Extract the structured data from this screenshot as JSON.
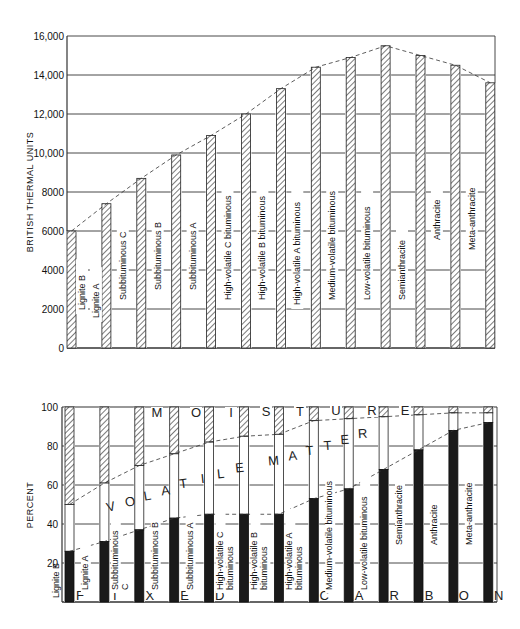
{
  "chart_data": [
    {
      "type": "bar",
      "title": "",
      "xlabel": "",
      "ylabel": "BRITISH THERMAL UNITS",
      "ylim": [
        0,
        16000
      ],
      "yticks": [
        "0",
        "2000",
        "4000",
        "6000",
        "8000",
        "10,000",
        "12,000",
        "14,000",
        "16,000"
      ],
      "grid": true,
      "trend_line": "dashed line connecting bar tops",
      "categories": [
        "Lignite B",
        "Lignite A",
        "Subbituminous C",
        "Subbituminous B",
        "Subbituminous A",
        "High-volatile C bituminous",
        "High-volatile B bituminous",
        "High-volatile A bituminous",
        "Medium-volatile bituminous",
        "Low-volatile bituminous",
        "Semianthracite",
        "Anthracite",
        "Meta-anthracite"
      ],
      "values": [
        6000,
        7400,
        8700,
        9900,
        10900,
        12000,
        13300,
        14400,
        14900,
        15500,
        15000,
        14500,
        13600
      ]
    },
    {
      "type": "bar",
      "stacked": true,
      "title": "",
      "xlabel": "",
      "ylabel": "PERCENT",
      "ylim": [
        0,
        100
      ],
      "yticks": [
        "20",
        "40",
        "60",
        "80",
        "100"
      ],
      "grid": true,
      "categories": [
        "Lignite B",
        "Lignite A",
        "Subbituminous C",
        "Subbituminous B",
        "Subbituminous A",
        "High-volatile C bituminous",
        "High-volatile B bituminous",
        "High-volatile A bituminous",
        "Medium-volatile bituminous",
        "Low-volatile bituminous",
        "Semianthracite",
        "Anthracite",
        "Meta-anthracite"
      ],
      "region_labels": {
        "moisture": "MOISTURE",
        "volatile_matter": "VOLATILE MATTER",
        "fixed_carbon": "FIXED CARBON"
      },
      "series": [
        {
          "name": "Fixed carbon",
          "fill": "solid black",
          "values": [
            26,
            31,
            37,
            43,
            45,
            45,
            45,
            53,
            58,
            68,
            78,
            88,
            92
          ]
        },
        {
          "name": "Volatile matter",
          "fill": "white",
          "values": [
            24,
            30,
            33,
            33,
            37,
            40,
            41,
            40,
            36,
            27,
            18,
            9,
            5
          ]
        },
        {
          "name": "Moisture",
          "fill": "hatched",
          "values": [
            50,
            39,
            30,
            24,
            18,
            15,
            14,
            7,
            6,
            5,
            4,
            3,
            3
          ]
        }
      ]
    }
  ],
  "top_chart": {
    "y_axis_label": "BRITISH THERMAL UNITS",
    "ticks": [
      {
        "label": "16,000",
        "value": 16000
      },
      {
        "label": "14,000",
        "value": 14000
      },
      {
        "label": "12,000",
        "value": 12000
      },
      {
        "label": "10,000",
        "value": 10000
      },
      {
        "label": "8000",
        "value": 8000
      },
      {
        "label": "6000",
        "value": 6000
      },
      {
        "label": "4000",
        "value": 4000
      },
      {
        "label": "2000",
        "value": 2000
      },
      {
        "label": "0",
        "value": 0
      }
    ],
    "bar_labels": [
      "Lignite B",
      "Lignite A",
      "Subbituminous C",
      "Subbituminous B",
      "Subbituminous A",
      "High-volatile C bituminous",
      "High-volatile B bituminous",
      "High-volatile A bituminous",
      "Medium-volatile bituminous",
      "Low-volatile bituminous",
      "Semianthracite",
      "Anthracite",
      "Meta-anthracite"
    ]
  },
  "bottom_chart": {
    "y_axis_label": "PERCENT",
    "ticks": [
      {
        "label": "100",
        "value": 100
      },
      {
        "label": "80",
        "value": 80
      },
      {
        "label": "60",
        "value": 60
      },
      {
        "label": "40",
        "value": 40
      },
      {
        "label": "20",
        "value": 20
      }
    ],
    "bar_labels": [
      [
        "Lignite B"
      ],
      [
        "Lignite A"
      ],
      [
        "Subbituminous",
        "C"
      ],
      [
        "Subbituminous B"
      ],
      [
        "Subbituminous A"
      ],
      [
        "High-volatile C",
        "bituminous"
      ],
      [
        "High-volatile B",
        "bituminous"
      ],
      [
        "High-volatile A",
        "bituminous"
      ],
      [
        "Medium-volatile bituminous"
      ],
      [
        "Low-volatile bituminous"
      ],
      [
        "Semianthracite"
      ],
      [
        "Anthracite"
      ],
      [
        "Meta-anthracite"
      ]
    ],
    "moisture_letters": [
      "M",
      "O",
      "I",
      "S",
      "T",
      "U",
      "R",
      "E"
    ],
    "volatile_letters": [
      "V",
      "O",
      "L",
      "A",
      "T",
      "I",
      "L",
      "E",
      "M",
      "A",
      "T",
      "T",
      "E",
      "R"
    ],
    "fixed_carbon_letters": [
      "F",
      "I",
      "X",
      "E",
      "D",
      "C",
      "A",
      "R",
      "B",
      "O",
      "N"
    ]
  }
}
